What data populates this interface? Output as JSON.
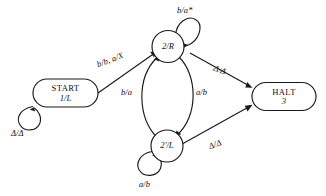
{
  "diagram": {
    "type": "state-machine",
    "stroke_color": "#1a1a1a",
    "background_color": "#ffffff",
    "states": [
      {
        "id": "start",
        "shape": "rounded-rectangle",
        "line1": "START",
        "line2": "1/L"
      },
      {
        "id": "s2r",
        "shape": "circle",
        "label": "2/R"
      },
      {
        "id": "s2pl",
        "shape": "circle",
        "label": "2'/L"
      },
      {
        "id": "halt",
        "shape": "rounded-rectangle",
        "line1": "HALT",
        "line2": "3"
      }
    ],
    "transitions": [
      {
        "id": "start-self",
        "from": "start",
        "to": "start",
        "label": "Δ/Δ",
        "kind": "self-loop"
      },
      {
        "id": "start-to-2r",
        "from": "start",
        "to": "s2r",
        "label": "b/b, a/X",
        "kind": "line"
      },
      {
        "id": "2r-self",
        "from": "s2r",
        "to": "s2r",
        "label": "b/a*",
        "kind": "self-loop"
      },
      {
        "id": "2r-to-halt",
        "from": "s2r",
        "to": "halt",
        "label": "Δ/Δ",
        "kind": "line"
      },
      {
        "id": "2pl-to-2r",
        "from": "s2pl",
        "to": "s2r",
        "label": "b/a",
        "kind": "curve"
      },
      {
        "id": "2r-to-2pl",
        "from": "s2r",
        "to": "s2pl",
        "label": "a/b",
        "kind": "curve"
      },
      {
        "id": "2pl-self",
        "from": "s2pl",
        "to": "s2pl",
        "label": "a/b",
        "kind": "self-loop"
      },
      {
        "id": "2pl-to-halt",
        "from": "s2pl",
        "to": "halt",
        "label": "Δ/Δ",
        "kind": "line"
      }
    ]
  }
}
